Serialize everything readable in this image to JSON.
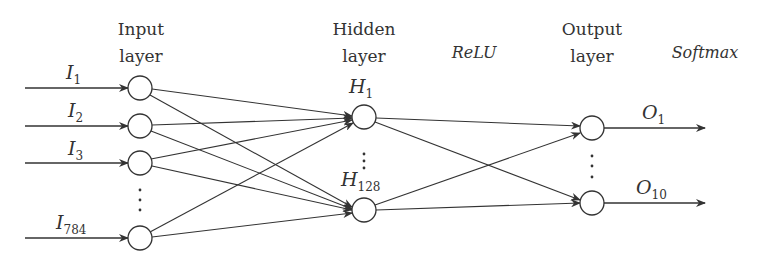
{
  "diagram": {
    "layers": [
      {
        "title_line1": "Input",
        "title_line2": "layer"
      },
      {
        "title_line1": "Hidden",
        "title_line2": "layer"
      },
      {
        "title_line1": "Output",
        "title_line2": "layer"
      }
    ],
    "activations": {
      "hidden": "ReLU",
      "output": "Softmax"
    },
    "inputs": [
      {
        "base": "I",
        "sub": "1"
      },
      {
        "base": "I",
        "sub": "2"
      },
      {
        "base": "I",
        "sub": "3"
      },
      {
        "base": "I",
        "sub": "784"
      }
    ],
    "hidden": [
      {
        "base": "H",
        "sub": "1"
      },
      {
        "base": "H",
        "sub": "128"
      }
    ],
    "outputs": [
      {
        "base": "O",
        "sub": "1"
      },
      {
        "base": "O",
        "sub": "10"
      }
    ],
    "ellipsis": "⋮",
    "colors": {
      "stroke": "#333333",
      "background": "#ffffff"
    }
  }
}
